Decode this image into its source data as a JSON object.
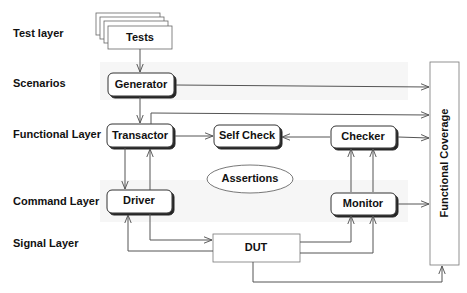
{
  "layers": [
    {
      "label": "Test layer"
    },
    {
      "label": "Scenarios"
    },
    {
      "label": "Functional Layer"
    },
    {
      "label": "Command Layer"
    },
    {
      "label": "Signal Layer"
    }
  ],
  "nodes": {
    "tests": {
      "label": "Tests",
      "shape": "stacked-sheets"
    },
    "generator": {
      "label": "Generator",
      "shape": "rounded-box"
    },
    "transactor": {
      "label": "Transactor",
      "shape": "rounded-box"
    },
    "self_check": {
      "label": "Self Check",
      "shape": "rounded-box"
    },
    "checker": {
      "label": "Checker",
      "shape": "rounded-box"
    },
    "assertions": {
      "label": "Assertions",
      "shape": "ellipse"
    },
    "driver": {
      "label": "Driver",
      "shape": "rounded-box"
    },
    "monitor": {
      "label": "Monitor",
      "shape": "rounded-box"
    },
    "dut": {
      "label": "DUT",
      "shape": "box"
    },
    "functional_coverage": {
      "label": "Functional Coverage",
      "shape": "tall-box"
    }
  },
  "edges": [
    {
      "from": "Tests",
      "to": "Generator"
    },
    {
      "from": "Generator",
      "to": "Transactor"
    },
    {
      "from": "Generator",
      "to": "Functional Coverage"
    },
    {
      "from": "Transactor",
      "to": "Functional Coverage"
    },
    {
      "from": "Transactor",
      "to": "Self Check"
    },
    {
      "from": "Checker",
      "to": "Self Check"
    },
    {
      "from": "Checker",
      "to": "Functional Coverage"
    },
    {
      "from": "Transactor",
      "to": "Driver"
    },
    {
      "from": "Driver",
      "to": "Transactor"
    },
    {
      "from": "Driver",
      "to": "DUT"
    },
    {
      "from": "DUT",
      "to": "Driver"
    },
    {
      "from": "DUT",
      "to": "Monitor"
    },
    {
      "from": "DUT",
      "to": "Monitor"
    },
    {
      "from": "Monitor",
      "to": "Checker"
    },
    {
      "from": "Monitor",
      "to": "Checker"
    },
    {
      "from": "Monitor",
      "to": "Functional Coverage"
    },
    {
      "from": "DUT",
      "to": "Functional Coverage"
    }
  ],
  "colors": {
    "stroke": "#555555",
    "text": "#111111",
    "band": "#f2f2f2",
    "background": "#ffffff"
  }
}
